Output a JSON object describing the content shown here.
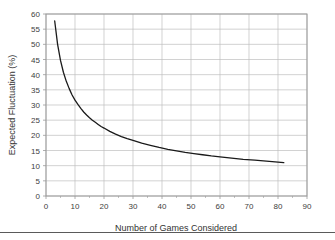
{
  "chart_data": {
    "type": "line",
    "title": "",
    "xlabel": "Number of Games Considered",
    "ylabel": "Expected Fluctuation (%)",
    "xlim": [
      0,
      90
    ],
    "ylim": [
      0,
      60
    ],
    "xticks": [
      0,
      10,
      20,
      30,
      40,
      50,
      60,
      70,
      80,
      90
    ],
    "yticks": [
      0,
      5,
      10,
      15,
      20,
      25,
      30,
      35,
      40,
      45,
      50,
      55,
      60
    ],
    "grid": true,
    "legend": false,
    "legend_position": "none",
    "series": [
      {
        "name": "Expected Fluctuation",
        "color": "#1a1a1a",
        "x": [
          3,
          4,
          5,
          6,
          7,
          8,
          9,
          10,
          11,
          12,
          13,
          14,
          15,
          16,
          17,
          18,
          19,
          20,
          22,
          24,
          26,
          28,
          30,
          33,
          36,
          39,
          42,
          45,
          48,
          51,
          54,
          57,
          60,
          64,
          68,
          72,
          76,
          80,
          82
        ],
        "values": [
          57.7,
          50.0,
          44.7,
          40.8,
          37.8,
          35.4,
          33.3,
          31.6,
          30.2,
          28.9,
          27.7,
          26.7,
          25.8,
          25.0,
          24.3,
          23.6,
          22.9,
          22.4,
          21.3,
          20.4,
          19.6,
          18.9,
          18.3,
          17.4,
          16.7,
          16.0,
          15.4,
          14.9,
          14.4,
          14.0,
          13.6,
          13.2,
          12.9,
          12.5,
          12.1,
          11.8,
          11.5,
          11.2,
          11.0
        ]
      }
    ]
  },
  "axes": {
    "x_tick_labels": [
      "0",
      "10",
      "20",
      "30",
      "40",
      "50",
      "60",
      "70",
      "80",
      "90"
    ],
    "y_tick_labels": [
      "0",
      "5",
      "10",
      "15",
      "20",
      "25",
      "30",
      "35",
      "40",
      "45",
      "50",
      "55",
      "60"
    ],
    "x_axis_title": "Number of Games Considered",
    "y_axis_title": "Expected Fluctuation (%)"
  },
  "colors": {
    "background": "#ffffff",
    "gridline": "#bfbfbf",
    "plot_border": "#9a9a9a",
    "series_line": "#1a1a1a",
    "tick_text": "#404040",
    "axis_title_text": "#333333",
    "bottom_rule": "#5a5a5a"
  }
}
